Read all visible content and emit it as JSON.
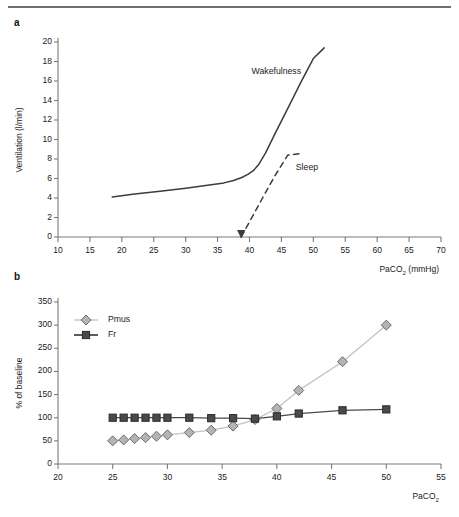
{
  "figure": {
    "panel_a_label": "a",
    "panel_b_label": "b"
  },
  "chart_data": [
    {
      "id": "panel_a",
      "type": "line",
      "title": "",
      "xlabel": "PaCO2 (mmHg)",
      "xlabel_prefix": "PaCO",
      "xlabel_sub": "2",
      "xlabel_suffix": " (mmHg)",
      "ylabel": "Ventilation (l/min)",
      "xlim": [
        10,
        70
      ],
      "ylim": [
        0,
        20
      ],
      "xticks": [
        10,
        15,
        20,
        25,
        30,
        35,
        40,
        45,
        50,
        55,
        60,
        65,
        70
      ],
      "yticks": [
        0,
        2,
        4,
        6,
        8,
        10,
        12,
        14,
        16,
        18,
        20
      ],
      "grid": false,
      "legend_position": "inline-annotation",
      "annotations": [
        {
          "text": "Wakefulness",
          "x": 44.2,
          "y": 16.9
        },
        {
          "text": "Sleep",
          "x": 49.0,
          "y": 7.1
        }
      ],
      "series": [
        {
          "name": "Wakefulness",
          "style": "solid",
          "color": "#3c3c3c",
          "x": [
            18.5,
            22,
            26,
            30,
            34,
            36,
            37.5,
            38.8,
            39.8,
            40.6,
            41.4,
            42.5,
            44,
            46,
            48,
            50,
            51.7
          ],
          "y": [
            4.1,
            4.4,
            4.7,
            5.0,
            5.35,
            5.55,
            5.8,
            6.1,
            6.45,
            6.8,
            7.4,
            8.6,
            10.6,
            13.2,
            15.8,
            18.3,
            19.4
          ]
        },
        {
          "name": "Sleep",
          "style": "dashed",
          "color": "#3c3c3c",
          "x": [
            38.7,
            40,
            42,
            44,
            46,
            47.9
          ],
          "y": [
            0.0,
            1.55,
            3.95,
            6.3,
            8.4,
            8.55
          ]
        }
      ],
      "arrow": {
        "x": 38.7,
        "y": 0,
        "direction": "down",
        "color": "#3c3c3c"
      }
    },
    {
      "id": "panel_b",
      "type": "line",
      "title": "",
      "xlabel": "PaCO2",
      "xlabel_prefix": "PaCO",
      "xlabel_sub": "2",
      "xlabel_suffix": "",
      "ylabel": "% of baseline",
      "xlim": [
        20,
        55
      ],
      "ylim": [
        0,
        350
      ],
      "xticks": [
        20,
        25,
        30,
        35,
        40,
        45,
        50,
        55
      ],
      "yticks": [
        0,
        50,
        100,
        150,
        200,
        250,
        300,
        350
      ],
      "grid": false,
      "legend_position": "top-left",
      "series": [
        {
          "name": "Pmus",
          "marker": "diamond",
          "marker_face": "#b4b4b4",
          "marker_edge": "#6b6b6b",
          "line_color": "#c2c2c2",
          "x": [
            25,
            26,
            27,
            28,
            29,
            30,
            32,
            34,
            36,
            38,
            40,
            42,
            46,
            50
          ],
          "y": [
            50,
            52,
            55,
            57,
            60,
            63,
            68,
            73,
            82,
            96,
            120,
            159,
            221,
            300
          ]
        },
        {
          "name": "Fr",
          "marker": "square",
          "marker_face": "#4a4a4a",
          "marker_edge": "#2a2a2a",
          "line_color": "#4a4a4a",
          "x": [
            25,
            26,
            27,
            28,
            29,
            30,
            32,
            34,
            36,
            38,
            40,
            42,
            46,
            50
          ],
          "y": [
            100,
            100,
            100,
            100,
            100,
            100,
            100,
            99,
            99,
            98,
            103,
            109,
            116,
            118
          ]
        }
      ]
    }
  ]
}
